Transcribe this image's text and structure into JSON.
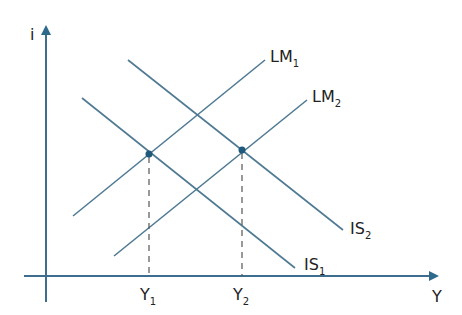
{
  "diagram": {
    "colors": {
      "axis": "#3d6e8f",
      "curve": "#4f7a93",
      "point": "#1f5a7d",
      "text": "#222222"
    },
    "axes": {
      "y_label": "i",
      "x_label": "Y"
    },
    "curves": [
      {
        "id": "LM1",
        "name": "LM",
        "sub": "1",
        "slope": "upward"
      },
      {
        "id": "LM2",
        "name": "LM",
        "sub": "2",
        "slope": "upward"
      },
      {
        "id": "IS1",
        "name": "IS",
        "sub": "1",
        "slope": "downward"
      },
      {
        "id": "IS2",
        "name": "IS",
        "sub": "2",
        "slope": "downward"
      }
    ],
    "equilibria": [
      {
        "id": "E1",
        "curves": [
          "IS1",
          "LM1"
        ],
        "x_label": "Y",
        "x_sub": "1"
      },
      {
        "id": "E2",
        "curves": [
          "IS2",
          "LM2"
        ],
        "x_label": "Y",
        "x_sub": "2"
      }
    ]
  }
}
